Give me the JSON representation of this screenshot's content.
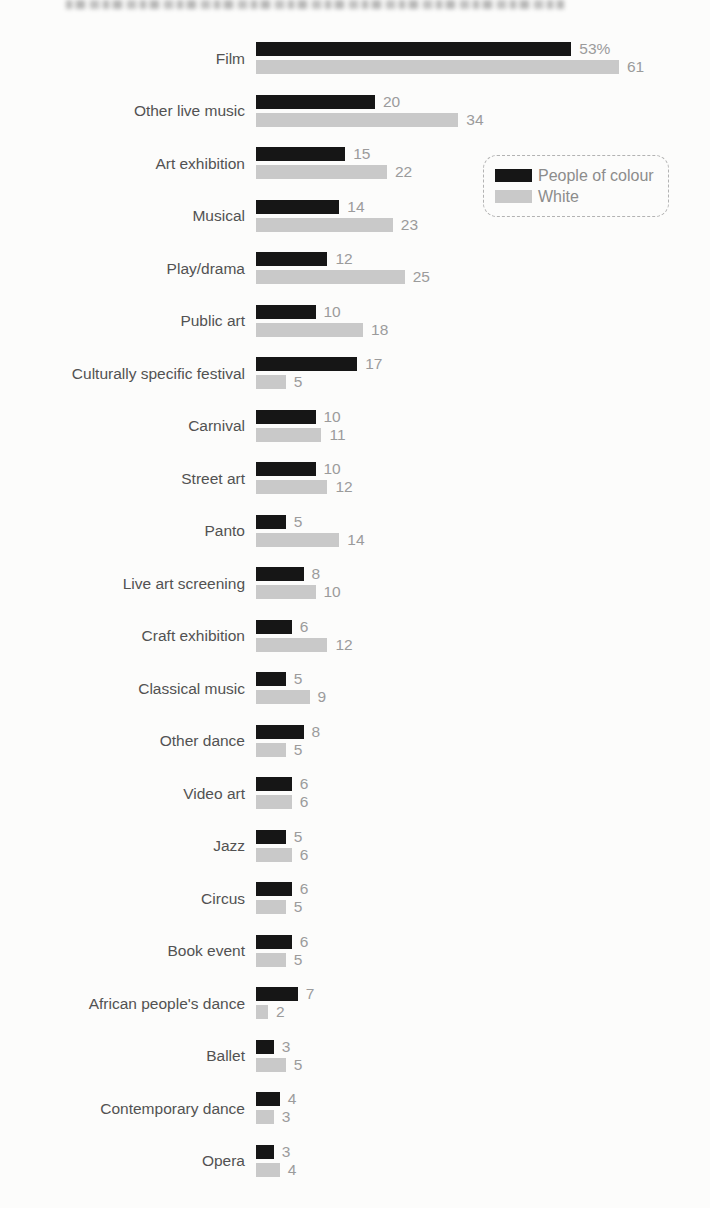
{
  "page": {
    "background": "#fcfcfb",
    "note": "scanned grouped horizontal bar chart, cropped blurry text line at top edge"
  },
  "chart_data": {
    "type": "bar",
    "orientation": "horizontal",
    "title": "",
    "xlabel": "",
    "ylabel": "",
    "xlim": [
      0,
      65
    ],
    "grid": false,
    "legend_position": "upper-right-inset",
    "unit": "percent",
    "category_label_color": "#525252",
    "value_label_color": "#9b9b9b",
    "categories": [
      "Film",
      "Other live music",
      "Art exhibition",
      "Musical",
      "Play/drama",
      "Public art",
      "Culturally specific festival",
      "Carnival",
      "Street art",
      "Panto",
      "Live art screening",
      "Craft exhibition",
      "Classical music",
      "Other dance",
      "Video art",
      "Jazz",
      "Circus",
      "Book event",
      "African people's dance",
      "Ballet",
      "Contemporary dance",
      "Opera"
    ],
    "series": [
      {
        "name": "People of colour",
        "color": "#161616",
        "values": [
          53,
          20,
          15,
          14,
          12,
          10,
          17,
          10,
          10,
          5,
          8,
          6,
          5,
          8,
          6,
          5,
          6,
          6,
          7,
          3,
          4,
          3
        ],
        "labels": [
          "53%",
          "20",
          "15",
          "14",
          "12",
          "10",
          "17",
          "10",
          "10",
          "5",
          "8",
          "6",
          "5",
          "8",
          "6",
          "5",
          "6",
          "6",
          "7",
          "3",
          "4",
          "3"
        ]
      },
      {
        "name": "White",
        "color": "#c9c9c9",
        "values": [
          61,
          34,
          22,
          23,
          25,
          18,
          5,
          11,
          12,
          14,
          10,
          12,
          9,
          5,
          6,
          6,
          5,
          5,
          2,
          5,
          3,
          4
        ],
        "labels": [
          "61",
          "34",
          "22",
          "23",
          "25",
          "18",
          "5",
          "11",
          "12",
          "14",
          "10",
          "12",
          "9",
          "5",
          "6",
          "6",
          "5",
          "5",
          "2",
          "5",
          "3",
          "4"
        ]
      }
    ]
  },
  "legend": {
    "border_style": "dashed rounded box",
    "items": [
      {
        "label": "People of colour",
        "color": "#161616"
      },
      {
        "label": "White",
        "color": "#c9c9c9"
      }
    ]
  }
}
